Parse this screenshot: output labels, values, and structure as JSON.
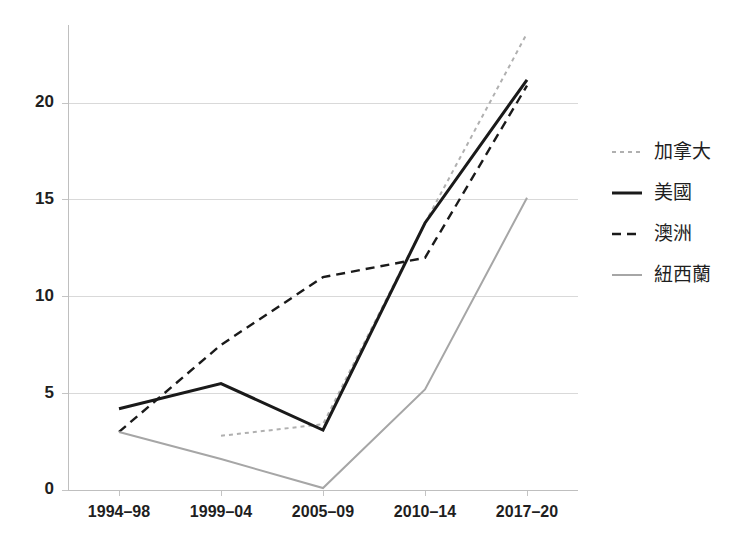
{
  "chart_data": {
    "type": "line",
    "title": "",
    "subtitle": "",
    "xlabel": "",
    "ylabel": "",
    "categories": [
      "1994–98",
      "1999–04",
      "2005–09",
      "2010–14",
      "2017–20"
    ],
    "ylim": [
      0,
      24
    ],
    "yticks": [
      0,
      5,
      10,
      15,
      20
    ],
    "ytick_labels": [
      "0",
      "5",
      "10",
      "15",
      "20"
    ],
    "grid": "horizontal",
    "legend_position": "right",
    "series": [
      {
        "name": "加拿大",
        "style": "dotted",
        "color": "#b0b0b0",
        "width": 2,
        "values": [
          null,
          2.8,
          3.4,
          13.8,
          23.6
        ]
      },
      {
        "name": "美國",
        "style": "solid",
        "color": "#1a1a1a",
        "width": 3,
        "values": [
          4.2,
          5.5,
          3.1,
          13.8,
          21.2
        ]
      },
      {
        "name": "澳洲",
        "style": "dashed",
        "color": "#1a1a1a",
        "width": 2.4,
        "values": [
          3.0,
          7.5,
          11.0,
          12.0,
          20.9
        ]
      },
      {
        "name": "紐西蘭",
        "style": "solid",
        "color": "#a6a6a6",
        "width": 2,
        "values": [
          3.0,
          1.6,
          0.1,
          5.2,
          15.1
        ]
      }
    ]
  },
  "legend": {
    "entries": [
      {
        "label": "加拿大"
      },
      {
        "label": "美國"
      },
      {
        "label": "澳洲"
      },
      {
        "label": "紐西蘭"
      }
    ]
  },
  "axes": {
    "y_tick_labels": [
      "0",
      "5",
      "10",
      "15",
      "20"
    ],
    "x_tick_labels": [
      "1994–98",
      "1999–04",
      "2005–09",
      "2010–14",
      "2017–20"
    ]
  },
  "colors": {
    "canada": "#b0b0b0",
    "usa": "#1a1a1a",
    "australia": "#1a1a1a",
    "new_zealand": "#a6a6a6",
    "grid": "#d9d9d9",
    "axis": "#bfbfbf",
    "text": "#1f1f1f",
    "background": "#ffffff"
  }
}
